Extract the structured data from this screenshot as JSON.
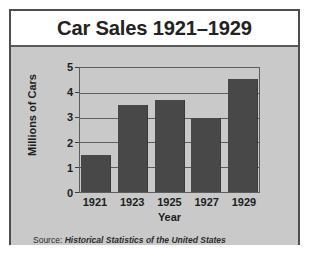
{
  "chart_data": {
    "type": "bar",
    "title": "Car Sales 1921–1929",
    "xlabel": "Year",
    "ylabel": "Millions of Cars",
    "categories": [
      "1921",
      "1923",
      "1925",
      "1927",
      "1929"
    ],
    "values": [
      1.5,
      3.5,
      3.7,
      3.0,
      4.55
    ],
    "ylim": [
      0,
      5
    ],
    "yticks": [
      "0",
      "1",
      "2",
      "3",
      "4",
      "5"
    ],
    "grid": true,
    "legend": false,
    "bar_color": "#484848",
    "plot_background": "#c9c9c9",
    "axis_color": "#5d5d5d",
    "title_color": "#232323"
  },
  "source": {
    "label": "Source:",
    "publication": "Historical Statistics of the United States"
  }
}
